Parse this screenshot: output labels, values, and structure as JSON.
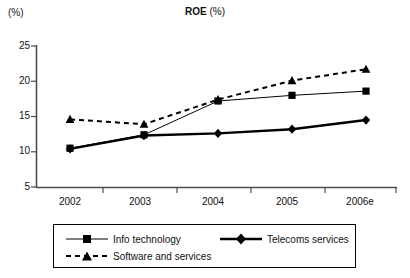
{
  "axis_unit_label": "(%)",
  "title": {
    "main": "ROE",
    "sub": " (%)"
  },
  "chart_data": {
    "type": "line",
    "title": "ROE (%)",
    "xlabel": "",
    "ylabel": "(%)",
    "ylim": [
      5,
      25
    ],
    "ytick_values": [
      "5",
      "10",
      "15",
      "20",
      "25"
    ],
    "grid": false,
    "legend_position": "bottom",
    "categories": [
      "2002",
      "2003",
      "2004",
      "2005",
      "2006e"
    ],
    "series": [
      {
        "name": "Info technology",
        "marker": "square",
        "line_style": "solid-thin",
        "color": "#000000",
        "values": [
          10.5,
          12.4,
          17.2,
          18.0,
          18.6
        ]
      },
      {
        "name": "Telecoms services",
        "marker": "diamond",
        "line_style": "solid-thick",
        "color": "#000000",
        "values": [
          10.4,
          12.3,
          12.6,
          13.2,
          14.5
        ]
      },
      {
        "name": "Software and services",
        "marker": "triangle",
        "line_style": "dashed",
        "color": "#000000",
        "values": [
          14.6,
          13.9,
          17.4,
          20.1,
          21.7
        ]
      }
    ]
  },
  "legend": {
    "items": [
      {
        "label": "Info technology"
      },
      {
        "label": "Telecoms services"
      },
      {
        "label": "Software and services"
      }
    ]
  }
}
